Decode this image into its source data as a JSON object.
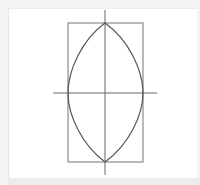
{
  "figure": {
    "type": "geometric-construction",
    "colors": {
      "stroke_rect": "#777777",
      "stroke_curve": "#555555",
      "stroke_axes": "#666666",
      "panel_bg": "#ffffff",
      "page_bg": "#f4f4f4"
    },
    "rectangle": {
      "x": 68,
      "y": 23,
      "width": 75,
      "height": 139
    },
    "center": {
      "x": 105,
      "y": 93
    },
    "horizontal_axis": {
      "x1": 53,
      "x2": 157,
      "y": 93
    },
    "vertical_axis": {
      "x": 105,
      "y1": 10,
      "y2": 175
    },
    "lens": {
      "top_apex": [
        105,
        23
      ],
      "bottom_apex": [
        105,
        162
      ],
      "left": [
        68,
        93
      ],
      "right": [
        143,
        93
      ]
    }
  }
}
